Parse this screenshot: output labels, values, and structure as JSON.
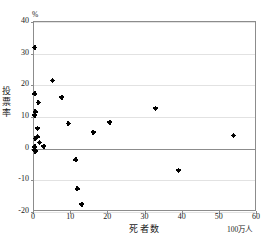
{
  "figure": {
    "top_caption": "",
    "background": "#ffffff",
    "frame_color": "#8c8c8c",
    "grid_color": "#e2e2e2",
    "marker_color": "#000000"
  },
  "chart_data": {
    "type": "scatter",
    "title": "",
    "xlabel": "死者数",
    "ylabel": "投票率",
    "y_unit": "%",
    "x_unit": "100万人",
    "xlim": [
      0,
      60
    ],
    "ylim": [
      -20,
      40
    ],
    "xticks": [
      0,
      10,
      20,
      30,
      40,
      50,
      60
    ],
    "yticks": [
      40,
      30,
      20,
      10,
      0,
      -10,
      -20
    ],
    "xtick_labels": [
      "0",
      "10",
      "20",
      "30",
      "40",
      "50",
      "60"
    ],
    "ytick_labels": [
      "40",
      "30",
      "20",
      "10",
      "0",
      "-10",
      "-20"
    ],
    "grid": "horizontal",
    "zero_line": true,
    "legend": null,
    "marker": "plus-dot",
    "points": [
      {
        "x": 0.2,
        "y": 32.0
      },
      {
        "x": 0.2,
        "y": 17.3
      },
      {
        "x": 1.1,
        "y": 14.6
      },
      {
        "x": 0.3,
        "y": 11.6
      },
      {
        "x": 0.2,
        "y": 10.6
      },
      {
        "x": 0.9,
        "y": 6.5
      },
      {
        "x": 0.3,
        "y": 3.3
      },
      {
        "x": 0.9,
        "y": 3.7
      },
      {
        "x": 1.5,
        "y": 2.0
      },
      {
        "x": 0.2,
        "y": 0.6
      },
      {
        "x": 0.2,
        "y": -0.4
      },
      {
        "x": 0.3,
        "y": -0.8
      },
      {
        "x": 2.6,
        "y": 0.8
      },
      {
        "x": 5.0,
        "y": 21.6
      },
      {
        "x": 7.5,
        "y": 16.3
      },
      {
        "x": 9.2,
        "y": 8.0
      },
      {
        "x": 11.3,
        "y": -3.5
      },
      {
        "x": 11.6,
        "y": -12.7
      },
      {
        "x": 12.9,
        "y": -17.5
      },
      {
        "x": 15.9,
        "y": 5.2
      },
      {
        "x": 20.4,
        "y": 8.4
      },
      {
        "x": 32.7,
        "y": 12.8
      },
      {
        "x": 38.9,
        "y": -6.8
      },
      {
        "x": 53.6,
        "y": 4.2
      }
    ]
  }
}
